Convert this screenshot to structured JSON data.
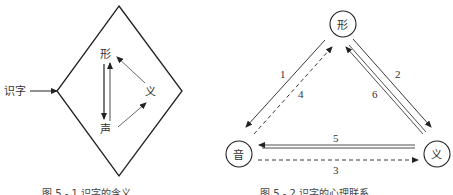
{
  "figure1": {
    "input_label": "识字",
    "nodes": {
      "shape": "形",
      "sound": "声",
      "meaning": "义"
    },
    "caption": "图 5 - 1 识字的含义"
  },
  "figure2": {
    "nodes": {
      "shape": "形",
      "sound": "音",
      "meaning": "义"
    },
    "edges": [
      {
        "id": "1",
        "from": "形",
        "to": "音",
        "style": "solid"
      },
      {
        "id": "2",
        "from": "形",
        "to": "义",
        "style": "solid"
      },
      {
        "id": "3",
        "from": "音",
        "to": "义",
        "style": "dashed"
      },
      {
        "id": "4",
        "from": "音",
        "to": "形",
        "style": "dashed"
      },
      {
        "id": "5",
        "from": "义",
        "to": "音",
        "style": "double"
      },
      {
        "id": "6",
        "from": "义",
        "to": "形",
        "style": "double"
      }
    ],
    "caption": "图 5 - 2 识字的心理联系"
  }
}
